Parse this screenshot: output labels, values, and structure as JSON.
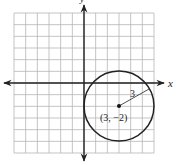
{
  "diagram": {
    "type": "coordinate-plane-circle",
    "axes": {
      "x_label": "x",
      "y_label": "y",
      "x_range": [
        -6,
        6
      ],
      "y_range": [
        -6,
        6
      ]
    },
    "grid": {
      "cells_x": 12,
      "cells_y": 12,
      "unit": 1
    },
    "circle": {
      "center": [
        3,
        -2
      ],
      "radius": 3,
      "center_label": "(3, −2)",
      "radius_label": "3"
    },
    "colors": {
      "grid": "#b5b5b5",
      "axis": "#222222",
      "circle": "#222222",
      "background": "#ffffff"
    }
  }
}
